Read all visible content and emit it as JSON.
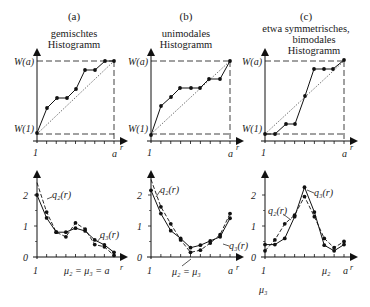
{
  "figure": {
    "panels": [
      {
        "id": "a",
        "label": "(a)",
        "title_lines": [
          "gemischtes",
          "Histogramm"
        ],
        "top": {
          "y_labels": {
            "top": "W(a)",
            "bottom": "W(1)"
          },
          "x_labels": {
            "start": "1",
            "end": "a",
            "axis": "r"
          },
          "points": [
            [
              37,
              133
            ],
            [
              47,
              108
            ],
            [
              57,
              98
            ],
            [
              67,
              98
            ],
            [
              76,
              89
            ],
            [
              85,
              70
            ],
            [
              95,
              70
            ],
            [
              105,
              61
            ],
            [
              114,
              61
            ]
          ]
        },
        "bottom": {
          "y_ticks": [
            "0",
            "1",
            "2"
          ],
          "x_labels": {
            "start": "1",
            "axis": "r"
          },
          "mu_label": "μ₂ = μ₃ = a",
          "q2_label": "q₂(r)",
          "q3_label": "q₃(r)",
          "q3_solid": [
            2.0,
            1.26,
            0.8,
            0.8,
            0.93,
            0.84,
            0.55,
            0.39,
            0.15
          ],
          "q2_dashed": [
            2.4,
            1.45,
            0.8,
            0.65,
            1.1,
            0.9,
            0.4,
            0.33,
            0.05
          ]
        }
      },
      {
        "id": "b",
        "label": "(b)",
        "title_lines": [
          "unimodales",
          "Histogramm"
        ],
        "top": {
          "y_labels": {
            "top": "W(a)",
            "bottom": "W(1)"
          },
          "x_labels": {
            "start": "1",
            "end": "a",
            "axis": "r"
          },
          "points": [
            [
              151,
              135
            ],
            [
              161,
              106
            ],
            [
              171,
              97
            ],
            [
              180,
              88
            ],
            [
              191,
              88
            ],
            [
              200,
              88
            ],
            [
              209,
              79
            ],
            [
              220,
              79
            ],
            [
              230,
              61
            ]
          ]
        },
        "bottom": {
          "y_ticks": [
            "0",
            "1",
            "2"
          ],
          "x_labels": {
            "start": "1",
            "end": "a",
            "axis": "r"
          },
          "mu_label": "μ₂ = μ₃",
          "q2_label": "q₂(r)",
          "q3_label": "q₃(r)",
          "q3_solid": [
            2.15,
            1.4,
            0.85,
            0.6,
            0.3,
            0.38,
            0.52,
            0.65,
            1.25
          ],
          "q2_dashed": [
            2.5,
            1.62,
            1.07,
            0.55,
            0.15,
            0.22,
            0.45,
            0.72,
            1.4
          ]
        }
      },
      {
        "id": "c",
        "label": "(c)",
        "title_lines": [
          "etwa symmetrisches,",
          "bimodales",
          "Histogramm"
        ],
        "top": {
          "y_labels": {
            "top": "W(a)",
            "bottom": "W(1)"
          },
          "x_labels": {
            "start": "1",
            "end": "a",
            "axis": "r"
          },
          "points": [
            [
              265,
              134
            ],
            [
              275,
              134
            ],
            [
              286,
              124
            ],
            [
              295,
              124
            ],
            [
              305,
              96
            ],
            [
              314,
              69
            ],
            [
              324,
              69
            ],
            [
              333,
              69
            ],
            [
              344,
              60
            ]
          ]
        },
        "bottom": {
          "y_ticks": [
            "0",
            "1",
            "2"
          ],
          "x_labels": {
            "start": "1",
            "end": "a",
            "axis": "r"
          },
          "mu2_label": "μ₂",
          "mu3_label": "μ₃",
          "q2_label": "q₂(r)",
          "q3_label": "q₃(r)",
          "q3_solid": [
            0.4,
            0.4,
            0.6,
            1.3,
            2.25,
            1.45,
            0.38,
            0.2,
            0.4
          ],
          "q2_dashed": [
            0.2,
            0.55,
            1.07,
            1.35,
            1.95,
            1.3,
            0.6,
            0.3,
            0.5
          ]
        }
      }
    ]
  }
}
